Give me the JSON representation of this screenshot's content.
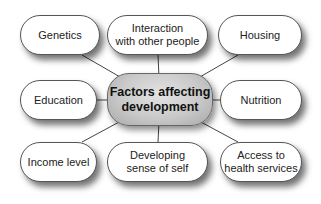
{
  "diagram": {
    "type": "mind-map",
    "center": {
      "label": "Factors affecting\ndevelopment"
    },
    "nodes": [
      {
        "id": "genetics",
        "label": "Genetics"
      },
      {
        "id": "interaction",
        "label": "Interaction\nwith other people"
      },
      {
        "id": "housing",
        "label": "Housing"
      },
      {
        "id": "education",
        "label": "Education"
      },
      {
        "id": "nutrition",
        "label": "Nutrition"
      },
      {
        "id": "income",
        "label": "Income level"
      },
      {
        "id": "self",
        "label": "Developing\nsense of self"
      },
      {
        "id": "health",
        "label": "Access to\nhealth services"
      }
    ],
    "edges": [
      [
        "center",
        "genetics"
      ],
      [
        "center",
        "interaction"
      ],
      [
        "center",
        "housing"
      ],
      [
        "center",
        "education"
      ],
      [
        "center",
        "nutrition"
      ],
      [
        "center",
        "income"
      ],
      [
        "center",
        "self"
      ],
      [
        "center",
        "health"
      ]
    ]
  }
}
